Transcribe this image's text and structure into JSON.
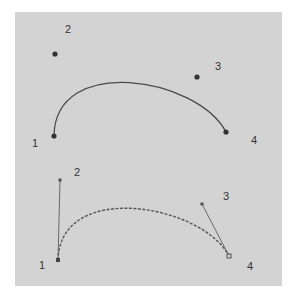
{
  "colors": {
    "background": "#ffffff",
    "panel": "#d3d3d3",
    "curve": "#4a4a4a",
    "point": "#333333",
    "handle": "#6a6a6a"
  },
  "diagram": {
    "top": {
      "description": "Cubic Bezier curve with four control points",
      "curve_style": "solid",
      "points": [
        {
          "label": "1",
          "x": 54,
          "y": 136
        },
        {
          "label": "2",
          "x": 55,
          "y": 54
        },
        {
          "label": "3",
          "x": 197,
          "y": 77
        },
        {
          "label": "4",
          "x": 226,
          "y": 132
        }
      ]
    },
    "bottom": {
      "description": "Cubic Bezier curve with tangent handles from endpoints",
      "curve_style": "dotted",
      "points": [
        {
          "label": "1",
          "x": 58,
          "y": 260
        },
        {
          "label": "2",
          "x": 60,
          "y": 180
        },
        {
          "label": "3",
          "x": 202,
          "y": 204
        },
        {
          "label": "4",
          "x": 229,
          "y": 256
        }
      ]
    }
  }
}
